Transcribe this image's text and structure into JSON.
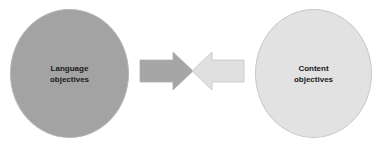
{
  "diagram": {
    "left_circle": {
      "label": "Language\nobjectives",
      "fill": "#a3a3a3"
    },
    "right_circle": {
      "label": "Content\nobjectives",
      "fill": "#e2e2e2"
    },
    "arrows": [
      {
        "direction": "right",
        "fill": "#a6a6a6"
      },
      {
        "direction": "left",
        "fill": "#e0e0e0"
      }
    ]
  }
}
